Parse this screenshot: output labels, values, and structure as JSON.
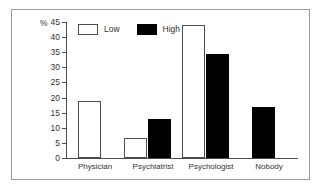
{
  "chart_data": {
    "type": "bar",
    "title": "",
    "xlabel": "",
    "ylabel": "%",
    "ylim": [
      0,
      45
    ],
    "grid": false,
    "legend_position": "top-left",
    "categories": [
      "Physician",
      "Psychiatrist",
      "Psychologist",
      "Nobody"
    ],
    "yticks": [
      "0",
      "5",
      "10",
      "15",
      "20",
      "25",
      "30",
      "35",
      "40",
      "45"
    ],
    "series": [
      {
        "name": "Low",
        "color": "#ffffff",
        "values": [
          19,
          6.5,
          44,
          null
        ]
      },
      {
        "name": "High",
        "color": "#000000",
        "values": [
          null,
          13,
          34.5,
          17
        ]
      }
    ]
  },
  "legend": {
    "items": [
      {
        "label": "Low",
        "style": "low"
      },
      {
        "label": "High",
        "style": "high"
      }
    ]
  }
}
